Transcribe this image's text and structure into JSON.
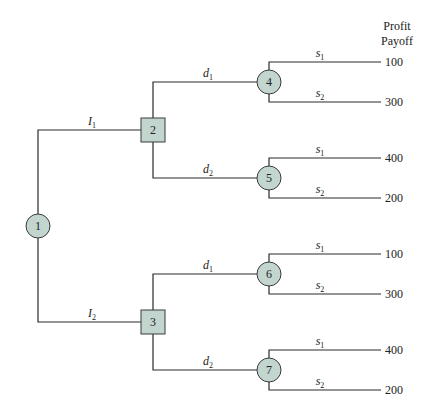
{
  "header": {
    "line1": "Profit",
    "line2": "Payoff"
  },
  "nodes": {
    "n1": {
      "label": "1",
      "type": "chance"
    },
    "n2": {
      "label": "2",
      "type": "decision"
    },
    "n3": {
      "label": "3",
      "type": "decision"
    },
    "n4": {
      "label": "4",
      "type": "chance"
    },
    "n5": {
      "label": "5",
      "type": "chance"
    },
    "n6": {
      "label": "6",
      "type": "chance"
    },
    "n7": {
      "label": "7",
      "type": "chance"
    }
  },
  "branches": {
    "i1": {
      "main": "I",
      "sub": "1"
    },
    "i2": {
      "main": "I",
      "sub": "2"
    },
    "d1": {
      "main": "d",
      "sub": "1"
    },
    "d2": {
      "main": "d",
      "sub": "2"
    },
    "s1": {
      "main": "s",
      "sub": "1"
    },
    "s2": {
      "main": "s",
      "sub": "2"
    }
  },
  "payoffs": [
    "100",
    "300",
    "400",
    "200",
    "100",
    "300",
    "400",
    "200"
  ],
  "colors": {
    "node_fill": "#c2d6cf",
    "line": "#2a2a2a"
  }
}
